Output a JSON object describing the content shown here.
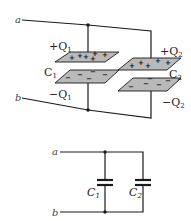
{
  "diagram": {
    "pictorial": {
      "terminal_a": "a",
      "terminal_b": "b",
      "capacitor_1": {
        "name": "C",
        "subscript": "1",
        "top_charge": "+Q",
        "top_charge_sub": "1",
        "bottom_charge": "−Q",
        "bottom_charge_sub": "1",
        "top_plate_sign": "+",
        "bottom_plate_sign": "−"
      },
      "capacitor_2": {
        "name": "C",
        "subscript": "2",
        "top_charge": "+Q",
        "top_charge_sub": "2",
        "bottom_charge": "−Q",
        "bottom_charge_sub": "2",
        "top_plate_sign": "+",
        "bottom_plate_sign": "−"
      }
    },
    "schematic": {
      "terminal_a": "a",
      "terminal_b": "b",
      "capacitor_1_label": "C",
      "capacitor_1_sub": "1",
      "capacitor_2_label": "C",
      "capacitor_2_sub": "2"
    },
    "colors": {
      "wire": "#1a1a1a",
      "plate_fill": "#b9b9b9",
      "background": "#ffffff"
    }
  }
}
